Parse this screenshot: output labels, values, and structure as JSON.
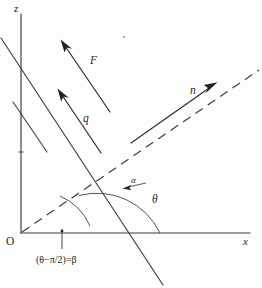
{
  "figure": {
    "axes": {
      "z_label": "z",
      "x_label": "x",
      "origin_label": "O"
    },
    "vectors": [
      {
        "name": "force-vector",
        "label": "F"
      },
      {
        "name": "flow-vector",
        "label": "q"
      },
      {
        "name": "normal-vector",
        "label": "n"
      }
    ],
    "angles": [
      {
        "name": "theta-angle",
        "label": "θ"
      },
      {
        "name": "alpha-angle",
        "label": "α"
      }
    ],
    "caption": "(θ−π/2)=β",
    "colors": {
      "ink": "#2e2e2e",
      "axis": "#3a3a3a",
      "arc": "#4a4a4a",
      "background": "#fdfdfd"
    }
  }
}
